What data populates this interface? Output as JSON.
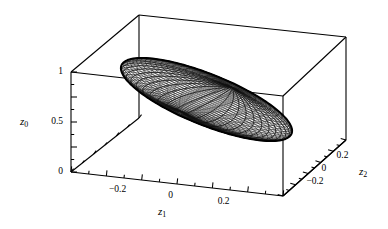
{
  "figure": {
    "type": "3d-wireframe-plot",
    "background_color": "#ffffff",
    "line_color": "#000000",
    "width": 388,
    "height": 229
  },
  "chart_data": {
    "type": "scatter",
    "render": "3d-ellipsoid-wireframe",
    "title": "",
    "subtitle": "",
    "xlabel": "z_1",
    "ylabel": "z_2",
    "zlabel": "z_0",
    "grid": false,
    "legend": null,
    "projection": {
      "kind": "axonometric",
      "box_corners_px": {
        "front_bottom_left": [
          71,
          172
        ],
        "front_bottom_right": [
          283,
          196
        ],
        "back_bottom_right": [
          346,
          140
        ],
        "back_bottom_left": [
          139,
          118
        ],
        "front_top_left": [
          71,
          72
        ],
        "front_top_right": [
          283,
          96
        ],
        "back_top_right": [
          346,
          37
        ],
        "back_top_left": [
          139,
          15
        ]
      }
    },
    "axes": [
      {
        "name": "z_0",
        "label": "z",
        "subscript": "0",
        "orientation": "vertical-left",
        "tick_labels": [
          "1",
          "0.5",
          "0"
        ],
        "tick_values": [
          1,
          0.5,
          0
        ],
        "minor_ticks": 4,
        "range": [
          0,
          1
        ]
      },
      {
        "name": "z_1",
        "label": "z",
        "subscript": "1",
        "orientation": "bottom-front",
        "tick_labels": [
          "-0.2",
          "0",
          "0.2"
        ],
        "tick_values": [
          -0.2,
          0,
          0.2
        ],
        "minor_ticks": 4,
        "range": [
          -0.36,
          0.36
        ]
      },
      {
        "name": "z_2",
        "label": "z",
        "subscript": "2",
        "orientation": "bottom-right",
        "tick_labels": [
          "-0.2",
          "0",
          "0.2"
        ],
        "tick_values": [
          -0.2,
          0,
          0.2
        ],
        "minor_ticks": 4,
        "range": [
          -0.3,
          0.3
        ]
      }
    ],
    "surface": {
      "shape": "ellipsoid",
      "style": "mesh-wireframe",
      "mesh_u_lines": 48,
      "mesh_v_lines": 40,
      "center": [
        0.0,
        0.0,
        0.62
      ],
      "semi_axes": [
        0.3,
        0.13,
        0.36
      ],
      "tilt_deg": 38,
      "stroke": "#111111",
      "fill": "#ffffff"
    }
  },
  "labels": {
    "z0": {
      "base": "z",
      "sub": "0"
    },
    "z1": {
      "base": "z",
      "sub": "1"
    },
    "z2": {
      "base": "z",
      "sub": "2"
    }
  },
  "tick_labels": {
    "z0": {
      "top": "1",
      "mid": "0.5",
      "bottom": "0"
    },
    "z1": {
      "neg": "−0.2",
      "zero": "0",
      "pos": "0.2"
    },
    "z2": {
      "neg": "−0.2",
      "zero": "0",
      "pos": "0.2"
    }
  }
}
